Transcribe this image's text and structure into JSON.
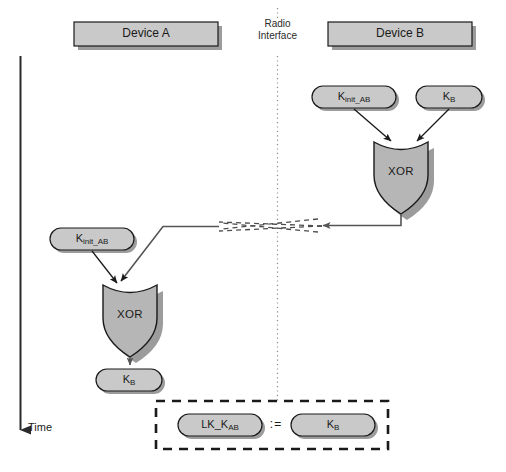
{
  "diagram": {
    "title_device_a": "Device A",
    "title_device_b": "Device B",
    "radio_interface_line1": "Radio",
    "radio_interface_line2": "Interface",
    "time_label": "Time",
    "assign_symbol": ":=",
    "gate_label_left": "XOR",
    "gate_label_right": "XOR",
    "colors": {
      "box_fill": "#c9c9c9",
      "gate_fill": "#b6b6b6",
      "oval_fill": "#c9c9c9",
      "stroke": "#1a1a1a",
      "shadow": "#9a9a9a",
      "radio_line": "#808080",
      "dash_line": "#4d4d4d",
      "background": "#ffffff"
    },
    "nodes": {
      "b_key_init": {
        "base": "K",
        "sub": "init_AB"
      },
      "b_key_b": {
        "base": "K",
        "sub": "B"
      },
      "a_key_init": {
        "base": "K",
        "sub": "init_AB"
      },
      "a_key_b_out": {
        "base": "K",
        "sub": "B"
      },
      "result_lk": {
        "base": "LK_K",
        "sub": "AB"
      },
      "result_kb": {
        "base": "K",
        "sub": "B"
      }
    }
  }
}
